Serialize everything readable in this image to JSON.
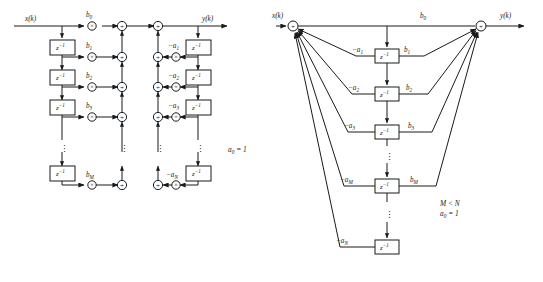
{
  "figure": {
    "background_color": "#ffffff",
    "line_color": "#1a1a1a"
  },
  "diagrams": [
    {
      "id": "direct-form-1",
      "position": "left",
      "input_label": "x(k)",
      "output_label": "y(k)",
      "feedforward_coefficients": [
        "b0",
        "b1",
        "b2",
        "b3",
        "bM"
      ],
      "feedback_coefficients": [
        "-a1",
        "-a2",
        "-a3",
        "-aN"
      ],
      "delay_label": "z",
      "delay_exponent": "-1",
      "delay_count_left": 4,
      "delay_count_right": 4,
      "adder_glyph": "+",
      "multiplier_glyph": "x",
      "vertical_ellipsis": ":",
      "annotation": "a0 = 1"
    },
    {
      "id": "direct-form-2",
      "position": "right",
      "input_label": "x(k)",
      "output_label": "y(k)",
      "feedforward_coefficients": [
        "b0",
        "b1",
        "b2",
        "b3",
        "bM"
      ],
      "feedback_coefficients": [
        "-a1",
        "-a2",
        "-a3",
        "-aM",
        "-aN"
      ],
      "delay_label": "z",
      "delay_exponent": "-1",
      "delay_count": 5,
      "adder_glyph": "+",
      "vertical_ellipsis": ":",
      "annotations": [
        "M < N",
        "a0 = 1"
      ]
    }
  ],
  "labels": {
    "x_of_k": "x(k)",
    "y_of_k": "y(k)",
    "b0": "b",
    "b0_sub": "0",
    "b1": "b",
    "b1_sub": "1",
    "b2": "b",
    "b2_sub": "2",
    "b3": "b",
    "b3_sub": "3",
    "bM": "b",
    "bM_sub": "M",
    "a1": "−a",
    "a1_sub": "1",
    "a2": "−a",
    "a2_sub": "2",
    "a3": "−a",
    "a3_sub": "3",
    "aM": "−a",
    "aM_sub": "M",
    "aN": "−a",
    "aN_sub": "N",
    "z": "z",
    "z_exp": "−1",
    "a0_eq_1_a": "a",
    "a0_eq_1_sub": "0",
    "a0_eq_1_rest": " = 1",
    "m_lt_n": "M < N",
    "plus": "+",
    "times": "×",
    "ellipsis": "⋮"
  }
}
